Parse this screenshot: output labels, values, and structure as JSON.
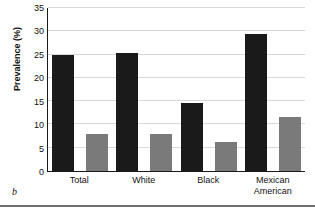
{
  "panel_label": "b",
  "chart_data": {
    "type": "bar",
    "title": "",
    "xlabel": "",
    "ylabel": "Prevalence (%)",
    "categories": [
      "Total",
      "White",
      "Black",
      "Mexican American"
    ],
    "category_lines": [
      [
        "Total"
      ],
      [
        "White"
      ],
      [
        "Black"
      ],
      [
        "Mexican",
        "American"
      ]
    ],
    "series": [
      {
        "name": "series-1",
        "color": "#1a1a1a",
        "values": [
          25.0,
          25.4,
          14.6,
          29.4
        ]
      },
      {
        "name": "series-2",
        "color": "#7a7a7a",
        "values": [
          8.0,
          7.9,
          6.3,
          11.6
        ]
      }
    ],
    "ylim": [
      0,
      35
    ],
    "yticks": [
      35,
      30,
      25,
      20,
      15,
      10,
      5,
      0
    ],
    "ytick_labels": [
      "35",
      "30",
      "25",
      "20",
      "15",
      "10",
      "5",
      "0"
    ],
    "grid": true,
    "legend": false,
    "legend_position": "none"
  }
}
